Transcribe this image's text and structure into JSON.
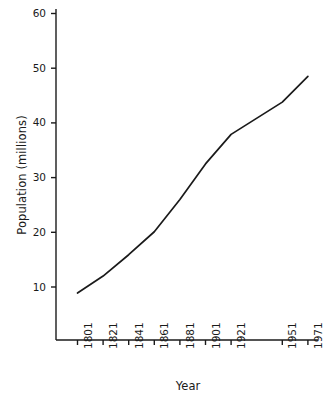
{
  "chart_data": {
    "type": "line",
    "title": "",
    "xlabel": "Year",
    "ylabel": "Population (millions)",
    "x": [
      1801,
      1821,
      1841,
      1861,
      1881,
      1901,
      1921,
      1951,
      1971
    ],
    "xtick_labels": [
      "1801",
      "1821",
      "1841",
      "1861",
      "1881",
      "1901",
      "1921",
      "1951",
      "1971"
    ],
    "values": [
      8.9,
      12.0,
      15.9,
      20.1,
      26.0,
      32.5,
      37.9,
      43.8,
      48.5
    ],
    "series": [
      {
        "name": "Population",
        "values": [
          8.9,
          12.0,
          15.9,
          20.1,
          26.0,
          32.5,
          37.9,
          43.8,
          48.5
        ]
      }
    ],
    "ytick_labels": [
      "10",
      "20",
      "30",
      "40",
      "50",
      "60"
    ],
    "yticks": [
      10,
      20,
      30,
      40,
      50,
      60
    ],
    "ylim": [
      4,
      60
    ],
    "xlim": [
      1795,
      1977
    ],
    "grid": false,
    "legend": false,
    "line_color": "#1a1a1a",
    "axis_color": "#1a1a1a"
  }
}
